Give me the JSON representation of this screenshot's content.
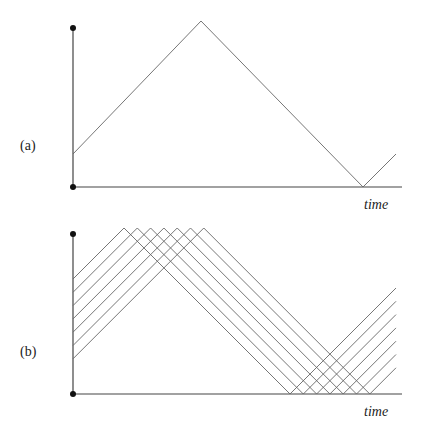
{
  "panels": [
    {
      "id": "a",
      "label": "(a)",
      "xlabel": "time",
      "description": "Single triangle wave bouncing between top and bottom bounds",
      "num_lines": 1
    },
    {
      "id": "b",
      "label": "(b)",
      "xlabel": "time",
      "description": "Seven parallel offset triangle waves bouncing between bounds",
      "num_lines": 7
    }
  ],
  "colors": {
    "axis": "#444444",
    "line": "#666666",
    "dot": "#111111"
  }
}
